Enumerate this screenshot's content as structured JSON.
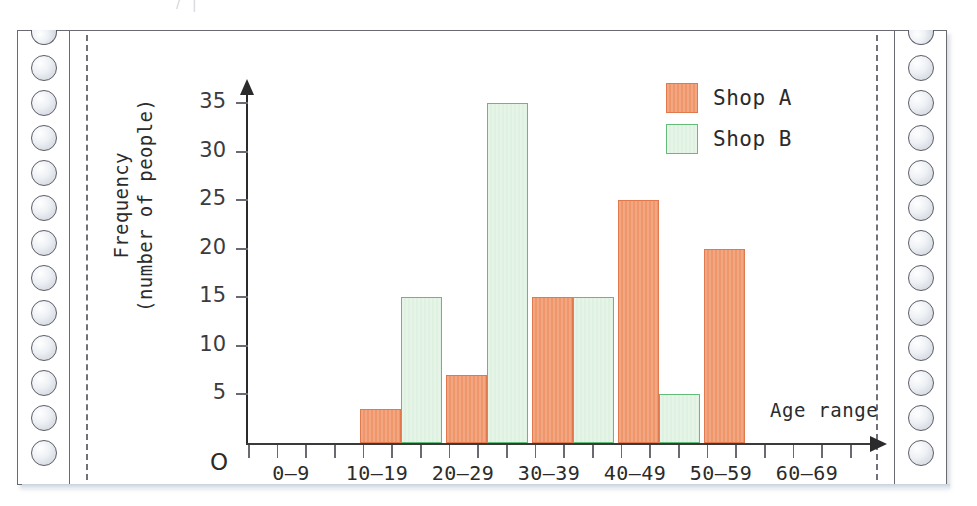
{
  "page": {
    "top_ghost_text": "/    |"
  },
  "axes": {
    "y_label_line1": "Frequency",
    "y_label_line2": "(number of people)",
    "x_label": "Age range",
    "origin_marker": "O",
    "y_ticks": [
      "5",
      "10",
      "15",
      "20",
      "25",
      "30",
      "35"
    ]
  },
  "legend": {
    "items": [
      {
        "label": "Shop A",
        "color": "#f0966b"
      },
      {
        "label": "Shop B",
        "color": "#dff2e2"
      }
    ]
  },
  "chart_data": {
    "type": "bar",
    "title": "",
    "xlabel": "Age range",
    "ylabel": "Frequency (number of people)",
    "categories": [
      "0–9",
      "10–19",
      "20–29",
      "30–39",
      "40–49",
      "50–59",
      "60–69"
    ],
    "series": [
      {
        "name": "Shop A",
        "color": "#f0966b",
        "values": [
          0,
          3.5,
          7,
          15,
          25,
          20,
          0
        ]
      },
      {
        "name": "Shop B",
        "color": "#dff2e2",
        "values": [
          0,
          15,
          35,
          15,
          5,
          0,
          0
        ]
      }
    ],
    "ylim": [
      0,
      37
    ],
    "ytick_step": 5,
    "grid": false,
    "legend_position": "top-right"
  }
}
